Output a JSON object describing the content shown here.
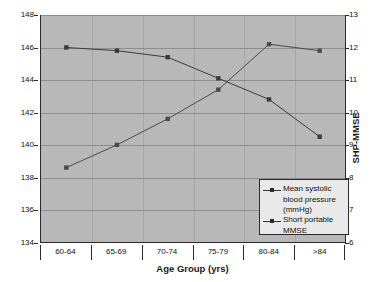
{
  "chart_data": {
    "type": "line",
    "title": "",
    "xlabel": "Age Group (yrs)",
    "ylabel": "Mean systolic blood pressure (mmHg)",
    "y2label": "SHP-MMSE",
    "categories": [
      "60-64",
      "65-69",
      "70-74",
      "75-79",
      "80-84",
      ">84"
    ],
    "ylim": [
      134,
      148
    ],
    "yticks": [
      "148",
      "146",
      "144",
      "142",
      "140",
      "138",
      "136",
      "134"
    ],
    "ytick_values": [
      148,
      146,
      144,
      142,
      140,
      138,
      136,
      134
    ],
    "y2lim": [
      6,
      13
    ],
    "y2ticks": [
      "13",
      "12",
      "11",
      "10",
      "9",
      "8",
      "7",
      "6"
    ],
    "y2tick_values": [
      13,
      12,
      11,
      10,
      9,
      8,
      7,
      6
    ],
    "grid": true,
    "legend_position": "inside-bottom-right",
    "series": [
      {
        "name": "Mean systolic blood pressure (mmHg)",
        "axis": "left",
        "marker": "square",
        "color": "#3a3a3a",
        "values": [
          146.0,
          145.8,
          145.4,
          144.1,
          142.8,
          140.5
        ]
      },
      {
        "name": "Short portable MMSE",
        "axis": "right",
        "marker": "square",
        "color": "#4a4a4a",
        "values": [
          8.3,
          9.0,
          9.8,
          10.7,
          12.1,
          11.9
        ]
      }
    ]
  },
  "legend": {
    "items": [
      {
        "label": "Mean systolic blood pressure (mmHg)"
      },
      {
        "label": "Short portable MMSE"
      }
    ]
  },
  "colors": {
    "plot_background": "#b8b8b8",
    "gridline": "#8d8d8d",
    "axis": "#2b2b2b",
    "legend_background": "#e9e9e9",
    "series_bp": "#3a3a3a",
    "series_mmse": "#4a4a4a"
  }
}
